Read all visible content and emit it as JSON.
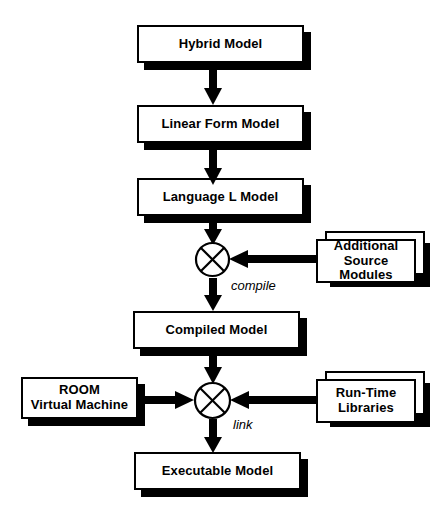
{
  "diagram": {
    "colors": {
      "stroke": "#000000",
      "fill": "#ffffff",
      "shadow": "#000000"
    },
    "nodes": [
      {
        "id": "hybrid",
        "label": "Hybrid Model",
        "kind": "box"
      },
      {
        "id": "linear",
        "label": "Linear Form Model",
        "kind": "box"
      },
      {
        "id": "language",
        "label": "Language L Model",
        "kind": "box"
      },
      {
        "id": "additional",
        "label": "Additional\nSource Modules",
        "line1": "Additional",
        "line2": "Source Modules",
        "kind": "stack"
      },
      {
        "id": "compiled",
        "label": "Compiled Model",
        "kind": "box"
      },
      {
        "id": "room",
        "label": "ROOM\nVirtual Machine",
        "line1": "ROOM",
        "line2": "Virtual Machine",
        "kind": "box"
      },
      {
        "id": "runtime",
        "label": "Run-Time\nLibraries",
        "line1": "Run-Time",
        "line2": "Libraries",
        "kind": "stack"
      },
      {
        "id": "executable",
        "label": "Executable Model",
        "kind": "box"
      }
    ],
    "junctions": [
      {
        "id": "compile-junction",
        "symbol": "circle-cross"
      },
      {
        "id": "link-junction",
        "symbol": "circle-cross"
      }
    ],
    "edge_labels": [
      {
        "id": "compile-label",
        "text": "compile"
      },
      {
        "id": "link-label",
        "text": "link"
      }
    ]
  }
}
